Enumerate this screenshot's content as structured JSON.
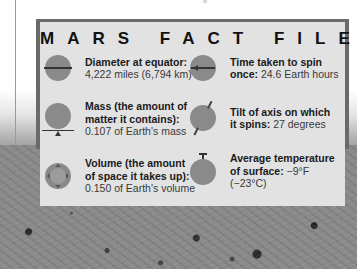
{
  "title": "MARS FACT FILE",
  "facts": [
    {
      "icon": "diameter-icon",
      "label": "Diameter at equator:",
      "value": "4,222 miles (6,794 km)"
    },
    {
      "icon": "spin-time-icon",
      "label_line1": "Time taken to spin",
      "label_line2": "once:",
      "value": "24.6 Earth hours"
    },
    {
      "icon": "mass-icon",
      "label_line1": "Mass (the amount of",
      "label_line2": "matter it contains):",
      "value": "0.107 of Earth's mass"
    },
    {
      "icon": "axis-tilt-icon",
      "label_line1": "Tilt of axis on which",
      "label_line2": "it spins:",
      "value": "27 degrees"
    },
    {
      "icon": "volume-icon",
      "label_line1": "Volume (the amount",
      "label_line2": "of space it takes up):",
      "value": "0.150 of Earth's volume"
    },
    {
      "icon": "temperature-icon",
      "label_line1": "Average temperature",
      "label_line2": "of surface:",
      "value": "−9°F (−23°C)"
    }
  ],
  "colors": {
    "panel_fill": "#e2e2e2",
    "panel_border": "#6a6a6a",
    "planet": "#8a8a8a"
  }
}
